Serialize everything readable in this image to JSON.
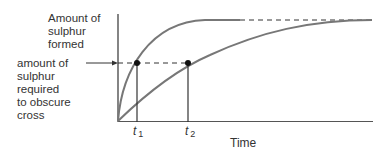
{
  "diagram": {
    "y_axis_label": [
      "Amount of",
      "sulphur",
      "formed"
    ],
    "threshold_label": [
      "amount of",
      "sulphur",
      "required",
      "to obscure",
      "cross"
    ],
    "x_axis_label": "Time",
    "tick_t1": {
      "base": "t",
      "sub": "1"
    },
    "tick_t2": {
      "base": "t",
      "sub": "2"
    },
    "colors": {
      "curve": "#777777",
      "axis": "#333333",
      "point": "#111111"
    }
  }
}
